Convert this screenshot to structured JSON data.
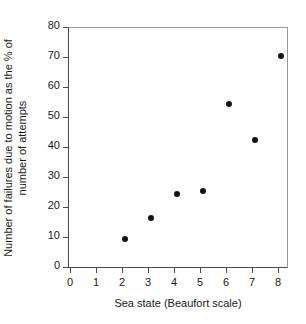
{
  "chart_data": {
    "type": "scatter",
    "title": "",
    "xlabel": "Sea state (Beaufort scale)",
    "ylabel_line1": "Number of failures due to motion as the % of",
    "ylabel_line2": "number of attempts",
    "ylabel": "Number of failures due to motion as the % of number of attempts",
    "x": [
      2,
      3,
      4,
      5,
      6,
      7,
      8
    ],
    "values": [
      10,
      17,
      25,
      26,
      55,
      43,
      71
    ],
    "points": [
      {
        "x": 2,
        "y": 10
      },
      {
        "x": 3,
        "y": 17
      },
      {
        "x": 4,
        "y": 25
      },
      {
        "x": 5,
        "y": 26
      },
      {
        "x": 6,
        "y": 55
      },
      {
        "x": 7,
        "y": 43
      },
      {
        "x": 8,
        "y": 71
      }
    ],
    "xlim": [
      0,
      8
    ],
    "ylim": [
      0,
      80
    ],
    "xticks": [
      0,
      1,
      2,
      3,
      4,
      5,
      6,
      7,
      8
    ],
    "yticks": [
      0,
      10,
      20,
      30,
      40,
      50,
      60,
      70,
      80
    ],
    "xtick_labels": [
      "0",
      "1",
      "2",
      "3",
      "4",
      "5",
      "6",
      "7",
      "8"
    ],
    "ytick_labels": [
      "0",
      "10",
      "20",
      "30",
      "40",
      "50",
      "60",
      "70",
      "80"
    ],
    "grid": false,
    "legend": false,
    "legend_position": "none",
    "marker": "filled-circle",
    "marker_color": "#141414",
    "background_color": "#ffffff",
    "axis_color": "#4a4a4a"
  }
}
